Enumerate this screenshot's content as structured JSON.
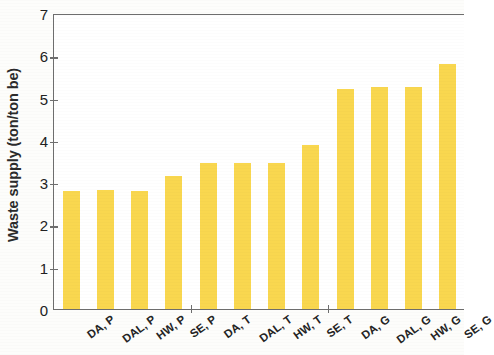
{
  "chart_data": {
    "type": "bar",
    "title": "",
    "xlabel": "",
    "ylabel": "Waste supply (ton/ton be)",
    "ylim": [
      0,
      7
    ],
    "ytick_labels": [
      "7",
      "6",
      "5",
      "4",
      "3",
      "2",
      "1",
      "0"
    ],
    "ytick_values": [
      7,
      6,
      5,
      4,
      3,
      2,
      1,
      0
    ],
    "grid": false,
    "legend": null,
    "bar_color": "#f9d74f",
    "axis_color": "#6e6e6e",
    "categories": [
      "DA, P",
      "DAL, P",
      "HW, P",
      "SE, P",
      "DA, T",
      "DAL, T",
      "HW, T",
      "SE, T",
      "DA, G",
      "DAL, G",
      "HW, G",
      "SE, G"
    ],
    "values": [
      2.8,
      2.82,
      2.8,
      3.15,
      3.45,
      3.45,
      3.45,
      3.88,
      5.2,
      5.25,
      5.25,
      5.8
    ]
  }
}
